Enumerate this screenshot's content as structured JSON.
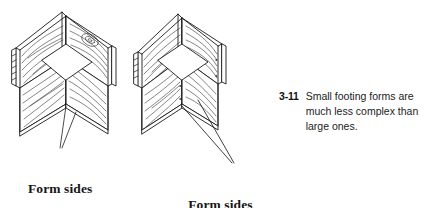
{
  "figure": {
    "number": "3-11",
    "caption_lines": [
      "Small footing forms are",
      "much less complex than",
      "large ones."
    ],
    "caption_full": "Small footing forms are much less complex than large ones."
  },
  "labels": {
    "left": {
      "lines": [
        "Form sides"
      ],
      "text": "Form sides"
    },
    "center": {
      "lines": [
        "Form sides",
        "nailed in position"
      ],
      "text": "Form sides nailed in position"
    }
  },
  "illustration": {
    "subject": "two isometric wooden footing form boxes with wood grain",
    "left_drawing_name": "footing-form-loose-sides",
    "right_drawing_name": "footing-form-nailed-sides",
    "style": "black line art on white"
  },
  "colors": {
    "background": "#ffffff",
    "ink": "#1a1a1a",
    "grain": "#2b2b2b",
    "leader": "#111111"
  }
}
